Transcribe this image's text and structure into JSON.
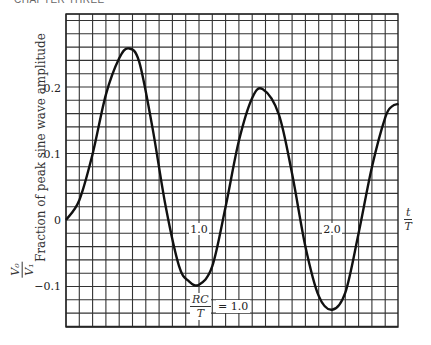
{
  "header": {
    "text": "CHAPTER THREE"
  },
  "chart_data": {
    "type": "line",
    "title": "",
    "xlabel": "t/T",
    "ylabel": "Fraction of peak sine wave amplitude",
    "ylabel_fraction": {
      "num": "V₀",
      "den": "V₁"
    },
    "xlim": [
      0,
      2.5
    ],
    "ylim": [
      -0.16,
      0.31
    ],
    "grid": true,
    "x_tick_labels": [
      {
        "x": 1.0,
        "label": "1.0"
      },
      {
        "x": 2.0,
        "label": "2.0"
      }
    ],
    "y_tick_labels": [
      {
        "y": 0.2,
        "label": "0.2"
      },
      {
        "y": 0.1,
        "label": "0.1"
      },
      {
        "y": 0,
        "label": "0"
      },
      {
        "y": -0.1,
        "label": "−0.1"
      }
    ],
    "annotation": {
      "num": "RC",
      "den": "T",
      "text": "= 1.0"
    },
    "series": [
      {
        "name": "RC/T = 1.0",
        "x": [
          0,
          0.1,
          0.2,
          0.3,
          0.4,
          0.47,
          0.55,
          0.65,
          0.75,
          0.85,
          0.92,
          1.0,
          1.1,
          1.2,
          1.3,
          1.4,
          1.48,
          1.6,
          1.7,
          1.8,
          1.9,
          2.0,
          2.1,
          2.2,
          2.3,
          2.4,
          2.45,
          2.5
        ],
        "values": [
          0,
          0.03,
          0.1,
          0.19,
          0.245,
          0.26,
          0.24,
          0.14,
          0.02,
          -0.07,
          -0.092,
          -0.098,
          -0.07,
          0.02,
          0.12,
          0.185,
          0.198,
          0.16,
          0.07,
          -0.04,
          -0.115,
          -0.136,
          -0.11,
          -0.02,
          0.08,
          0.155,
          0.172,
          0.176
        ]
      }
    ]
  }
}
